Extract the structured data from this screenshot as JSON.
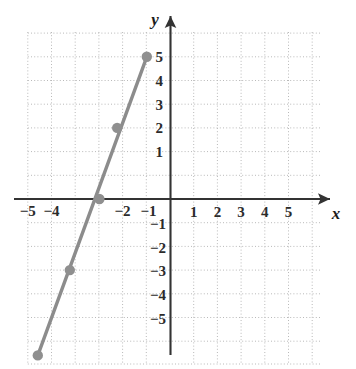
{
  "chart_data": {
    "type": "line",
    "title": "",
    "xlabel": "x",
    "ylabel": "y",
    "grid": true,
    "grid_style": "dotted",
    "legend": "none",
    "xlim": [
      -6.2,
      6.6
    ],
    "ylim": [
      -7.2,
      7.0
    ],
    "x_ticks": [
      -5,
      -4,
      -2,
      -1,
      1,
      2,
      3,
      4,
      5
    ],
    "x_tick_labels": [
      "−5",
      "−4",
      "−2",
      "−1",
      "1",
      "2",
      "3",
      "4",
      "5"
    ],
    "y_ticks": [
      5,
      4,
      3,
      2,
      1,
      -1,
      -2,
      -3,
      -4,
      -5
    ],
    "y_tick_labels": [
      "5",
      "4",
      "3",
      "2",
      "1",
      "−1",
      "−2",
      "−3",
      "−4",
      "−5"
    ],
    "series": [
      {
        "name": "line",
        "color": "#8c8c8c",
        "slope": 2.4,
        "y_intercept": 7.2,
        "x_intercept": -3,
        "marker": "filled-circle",
        "points": [
          {
            "x": -1.0,
            "y": 6.0
          },
          {
            "x": -2.25,
            "y": 3.0
          },
          {
            "x": -3.0,
            "y": 0.0
          },
          {
            "x": -4.25,
            "y": -3.0
          },
          {
            "x": -5.6,
            "y": -6.6
          }
        ]
      }
    ],
    "colors": {
      "line": "#8c8c8c",
      "marker": "#8f8f8f",
      "axis": "#333333",
      "grid": "#bbbbbb",
      "text": "#2b2b2b",
      "background": "#ffffff"
    }
  },
  "axes": {
    "x_axis_label": "x",
    "y_axis_label": "y"
  }
}
